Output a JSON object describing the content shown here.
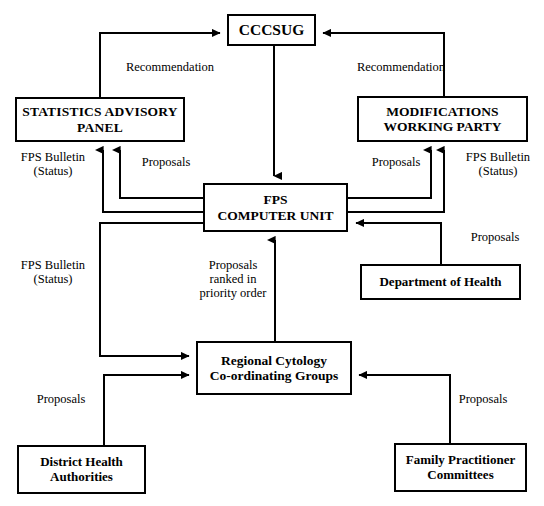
{
  "diagram": {
    "stroke_color": "#000000",
    "background_color": "#ffffff",
    "nodes": [
      {
        "id": "cccsug",
        "label": "CCCSUG"
      },
      {
        "id": "statistics_advisory_panel",
        "label": "STATISTICS ADVISORY\nPANEL"
      },
      {
        "id": "modifications_working_party",
        "label": "MODIFICATIONS\nWORKING PARTY"
      },
      {
        "id": "fps_computer_unit",
        "label": "FPS\nCOMPUTER UNIT"
      },
      {
        "id": "department_of_health",
        "label": "Department of Health"
      },
      {
        "id": "regional_cytology_coordinating_groups",
        "label": "Regional Cytology\nCo-ordinating Groups"
      },
      {
        "id": "district_health_authorities",
        "label": "District Health\nAuthorities"
      },
      {
        "id": "family_practitioner_committees",
        "label": "Family Practitioner\nCommittees"
      }
    ],
    "edge_labels": [
      {
        "id": "recommendation_left",
        "text": "Recommendation",
        "from": "statistics_advisory_panel",
        "to": "cccsug"
      },
      {
        "id": "recommendation_right",
        "text": "Recommendation",
        "from": "modifications_working_party",
        "to": "cccsug"
      },
      {
        "id": "fps_bulletin_status_left_upper",
        "text": "FPS Bulletin\n(Status)",
        "from": "fps_computer_unit",
        "to": "statistics_advisory_panel"
      },
      {
        "id": "proposals_left_upper",
        "text": "Proposals",
        "from": "statistics_advisory_panel",
        "to": "fps_computer_unit"
      },
      {
        "id": "proposals_right_upper",
        "text": "Proposals",
        "from": "modifications_working_party",
        "to": "fps_computer_unit"
      },
      {
        "id": "fps_bulletin_status_right_upper",
        "text": "FPS Bulletin\n(Status)",
        "from": "fps_computer_unit",
        "to": "modifications_working_party"
      },
      {
        "id": "proposals_department_of_health",
        "text": "Proposals",
        "from": "department_of_health",
        "to": "fps_computer_unit"
      },
      {
        "id": "fps_bulletin_status_lower_left",
        "text": "FPS Bulletin\n(Status)",
        "from": "fps_computer_unit",
        "to": "regional_cytology_coordinating_groups"
      },
      {
        "id": "proposals_ranked_priority",
        "text": "Proposals\nranked in\npriority order",
        "from": "regional_cytology_coordinating_groups",
        "to": "fps_computer_unit"
      },
      {
        "id": "proposals_district_health",
        "text": "Proposals",
        "from": "district_health_authorities",
        "to": "regional_cytology_coordinating_groups"
      },
      {
        "id": "proposals_family_practitioner",
        "text": "Proposals",
        "from": "family_practitioner_committees",
        "to": "regional_cytology_coordinating_groups"
      }
    ]
  }
}
